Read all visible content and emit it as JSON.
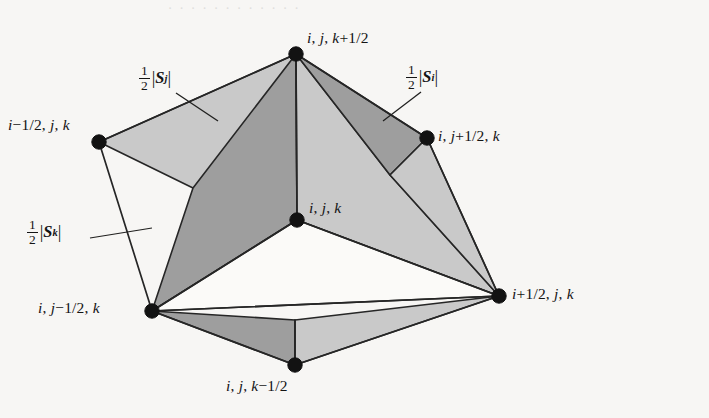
{
  "figure": {
    "type": "geometric-diagram",
    "background_color": "#f7f6f4",
    "line_color": "#262626",
    "fill_light": "#c9c9c9",
    "fill_mid": "#9e9e9e",
    "fill_white": "#fbfaf8"
  },
  "artifacts": {
    "top_bleed_text": "· · · · · · · · · · · ·",
    "middle_bleed_text": "· · · · · · · · · ·"
  },
  "vertices": [
    {
      "id": "top",
      "label": "i, j, k+1/2",
      "x": 296,
      "y": 54
    },
    {
      "id": "left",
      "label": "i−1/2, j, k",
      "x": 99,
      "y": 142
    },
    {
      "id": "right",
      "label": "i, j+1/2, k",
      "x": 427,
      "y": 138
    },
    {
      "id": "center",
      "label": "i, j, k",
      "x": 297,
      "y": 220
    },
    {
      "id": "bottom-left",
      "label": "i, j−1/2, k",
      "x": 152,
      "y": 311
    },
    {
      "id": "far-right",
      "label": "i+1/2, j, k",
      "x": 499,
      "y": 296
    },
    {
      "id": "bottom",
      "label": "i, j, k−1/2",
      "x": 295,
      "y": 365
    }
  ],
  "vertex_labels": [
    {
      "id": "top",
      "text": "i, j, k+1/2",
      "x": 307,
      "y": 29
    },
    {
      "id": "left",
      "text": "i−1/2, j, k",
      "x": 8,
      "y": 116
    },
    {
      "id": "right",
      "text": "i, j+1/2, k",
      "x": 438,
      "y": 127
    },
    {
      "id": "center",
      "text": "i, j, k",
      "x": 309,
      "y": 199
    },
    {
      "id": "bottom-left",
      "text": "i, j−1/2, k",
      "x": 38,
      "y": 299
    },
    {
      "id": "far-right",
      "text": "i+1/2, j, k",
      "x": 512,
      "y": 285
    },
    {
      "id": "bottom",
      "text": "i, j, k−1/2",
      "x": 226,
      "y": 377
    }
  ],
  "area_labels": [
    {
      "id": "half-Sj",
      "numerator": "1",
      "denominator": "2",
      "symbol": "S",
      "superscript": "j",
      "x": 139,
      "y": 64,
      "leader": {
        "x1": 176,
        "y1": 93,
        "x2": 218,
        "y2": 121
      }
    },
    {
      "id": "half-Si",
      "numerator": "1",
      "denominator": "2",
      "symbol": "S",
      "superscript": "i",
      "x": 406,
      "y": 63,
      "leader": {
        "x1": 421,
        "y1": 92,
        "x2": 383,
        "y2": 121
      }
    },
    {
      "id": "half-Sk",
      "numerator": "1",
      "denominator": "2",
      "symbol": "S",
      "superscript": "k",
      "x": 27,
      "y": 218,
      "leader": {
        "x1": 90,
        "y1": 238,
        "x2": 152,
        "y2": 228
      }
    }
  ],
  "faces": [
    {
      "id": "top-left-upper",
      "shade": "light",
      "points": "296,54 99,142 193,188 297,220"
    },
    {
      "id": "top-center-left",
      "shade": "mid",
      "points": "296,54 193,188 152,311 297,220"
    },
    {
      "id": "top-center-right",
      "shade": "light",
      "points": "296,54 297,220 499,296 390,175"
    },
    {
      "id": "top-right-upper",
      "shade": "mid",
      "points": "296,54 390,175 427,138"
    },
    {
      "id": "right-wedge",
      "shade": "light",
      "points": "427,138 390,175 499,296"
    },
    {
      "id": "bottom-left-front",
      "shade": "mid",
      "points": "152,311 295,365 295,320"
    },
    {
      "id": "bottom-right-front",
      "shade": "light",
      "points": "295,320 295,365 499,296"
    },
    {
      "id": "center-bottom-void",
      "shade": "white",
      "points": "297,220 152,311 499,296"
    }
  ],
  "edges": [
    {
      "id": "top-to-left",
      "x1": 296,
      "y1": 54,
      "x2": 99,
      "y2": 142
    },
    {
      "id": "top-to-center",
      "x1": 296,
      "y1": 54,
      "x2": 297,
      "y2": 220
    },
    {
      "id": "top-to-right",
      "x1": 296,
      "y1": 54,
      "x2": 427,
      "y2": 138
    },
    {
      "id": "left-to-bottomleft",
      "x1": 99,
      "y1": 142,
      "x2": 152,
      "y2": 311
    },
    {
      "id": "right-to-farright",
      "x1": 427,
      "y1": 138,
      "x2": 499,
      "y2": 296
    },
    {
      "id": "center-to-bl",
      "x1": 297,
      "y1": 220,
      "x2": 152,
      "y2": 311
    },
    {
      "id": "center-to-fr",
      "x1": 297,
      "y1": 220,
      "x2": 499,
      "y2": 296
    },
    {
      "id": "bl-to-fr",
      "x1": 152,
      "y1": 311,
      "x2": 499,
      "y2": 296
    },
    {
      "id": "bl-to-bottom",
      "x1": 152,
      "y1": 311,
      "x2": 295,
      "y2": 365
    },
    {
      "id": "bottom-to-fr",
      "x1": 295,
      "y1": 365,
      "x2": 499,
      "y2": 296
    },
    {
      "id": "bottom-to-seam",
      "x1": 295,
      "y1": 365,
      "x2": 295,
      "y2": 320
    }
  ]
}
